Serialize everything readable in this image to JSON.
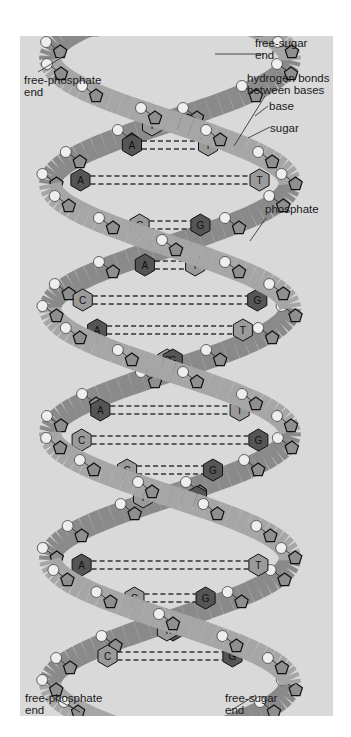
{
  "header": {
    "text": ""
  },
  "figure": {
    "colors": {
      "panel_background": "#d9d9d9",
      "strand_front": "#a6a6a6",
      "strand_back": "#8a8a8a",
      "purine_base": "#555555",
      "pyrimidine_base": "#9a9a9a",
      "phosphate": "#eeeeee",
      "label_text": "#1a1a1a"
    },
    "labels": {
      "free_phosphate_top": "free-phosphate\nend",
      "free_sugar_top": "free-sugar\nend",
      "hydrogen_bonds": "hydrogen bonds\nbetween bases",
      "base": "base",
      "sugar": "sugar",
      "phosphate": "phosphate",
      "free_phosphate_bottom": "free-phosphate\nend",
      "free_sugar_bottom": "free-sugar\nend"
    },
    "base_pairs": [
      {
        "left": "A",
        "right": "T",
        "y": 125
      },
      {
        "left": "A",
        "right": "T",
        "y": 145
      },
      {
        "left": "A",
        "right": "T",
        "y": 180
      },
      {
        "left": "C",
        "right": "G",
        "y": 225
      },
      {
        "left": "A",
        "right": "T",
        "y": 265
      },
      {
        "left": "C",
        "right": "G",
        "y": 300
      },
      {
        "left": "A",
        "right": "T",
        "y": 330
      },
      {
        "left": "C",
        "right": "G",
        "y": 360
      },
      {
        "left": "A",
        "right": "T",
        "y": 410
      },
      {
        "left": "C",
        "right": "G",
        "y": 440
      },
      {
        "left": "C",
        "right": "G",
        "y": 470
      },
      {
        "left": "A",
        "right": "T",
        "y": 497
      },
      {
        "left": "A",
        "right": "T",
        "y": 565
      },
      {
        "left": "C",
        "right": "G",
        "y": 598
      },
      {
        "left": "A",
        "right": "T",
        "y": 630
      },
      {
        "left": "C",
        "right": "G",
        "y": 656
      }
    ]
  }
}
